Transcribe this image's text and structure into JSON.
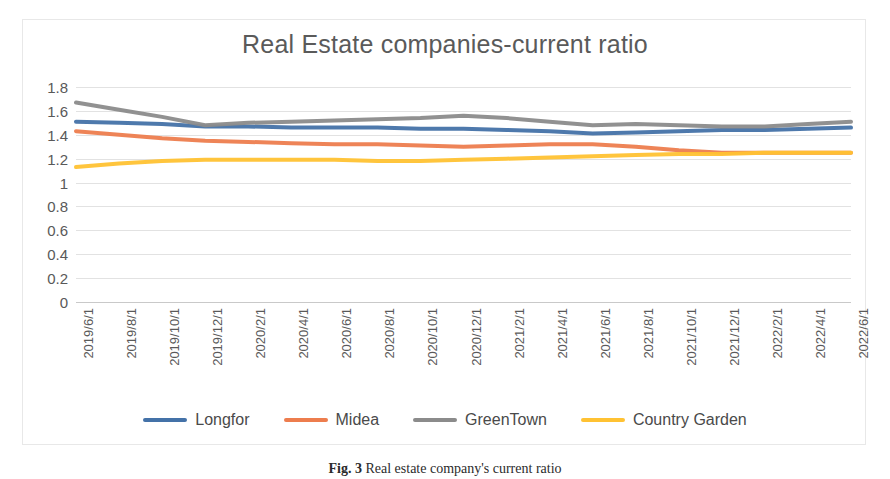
{
  "chart_data": {
    "type": "line",
    "title": "Real Estate companies-current ratio",
    "xlabel": "",
    "ylabel": "",
    "ylim": [
      0,
      1.8
    ],
    "yticks": [
      "0",
      "0.2",
      "0.4",
      "0.6",
      "0.8",
      "1",
      "1.2",
      "1.4",
      "1.6",
      "1.8"
    ],
    "grid": true,
    "legend_position": "bottom",
    "categories": [
      "2019/6/1",
      "2019/8/1",
      "2019/10/1",
      "2019/12/1",
      "2020/2/1",
      "2020/4/1",
      "2020/6/1",
      "2020/8/1",
      "2020/10/1",
      "2020/12/1",
      "2021/2/1",
      "2021/4/1",
      "2021/6/1",
      "2021/8/1",
      "2021/10/1",
      "2021/12/1",
      "2022/2/1",
      "2022/4/1",
      "2022/6/1"
    ],
    "series": [
      {
        "name": "Longfor",
        "color": "#4472a8",
        "values": [
          1.51,
          1.5,
          1.49,
          1.47,
          1.47,
          1.46,
          1.46,
          1.46,
          1.45,
          1.45,
          1.44,
          1.43,
          1.41,
          1.42,
          1.43,
          1.44,
          1.44,
          1.45,
          1.46
        ]
      },
      {
        "name": "Midea",
        "color": "#ed7d4e",
        "values": [
          1.43,
          1.4,
          1.37,
          1.35,
          1.34,
          1.33,
          1.32,
          1.32,
          1.31,
          1.3,
          1.31,
          1.32,
          1.32,
          1.3,
          1.27,
          1.25,
          1.25,
          1.25,
          1.25
        ]
      },
      {
        "name": "GreenTown",
        "color": "#8b8b8b",
        "values": [
          1.67,
          1.61,
          1.55,
          1.48,
          1.5,
          1.51,
          1.52,
          1.53,
          1.54,
          1.56,
          1.54,
          1.51,
          1.48,
          1.49,
          1.48,
          1.47,
          1.47,
          1.49,
          1.51
        ]
      },
      {
        "name": "Country Garden",
        "color": "#ffc233",
        "values": [
          1.13,
          1.16,
          1.18,
          1.19,
          1.19,
          1.19,
          1.19,
          1.18,
          1.18,
          1.19,
          1.2,
          1.21,
          1.22,
          1.23,
          1.24,
          1.24,
          1.25,
          1.25,
          1.25
        ]
      }
    ]
  },
  "caption": {
    "label": "Fig. 3",
    "text": "Real estate company's current ratio"
  }
}
